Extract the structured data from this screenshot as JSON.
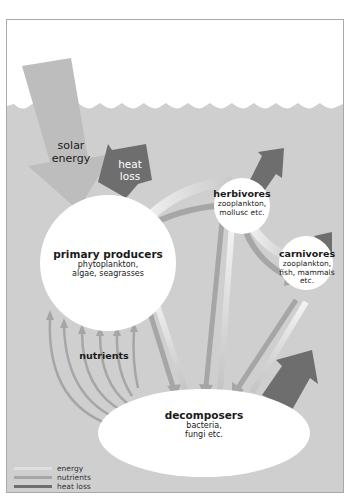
{
  "colors": {
    "background": "#ffffff",
    "water": "#cfcfcf",
    "frame": "#a9a9a9",
    "energy": "#dedede",
    "nutrients": "#a6a6a6",
    "heat_loss": "#6e6e6e",
    "node_fill": "#ffffff"
  },
  "labels": {
    "solar_energy": [
      "solar",
      "energy"
    ],
    "heat_loss": [
      "heat",
      "loss"
    ],
    "nutrients": "nutrients"
  },
  "nodes": {
    "primary_producers": {
      "title": "primary producers",
      "lines": [
        "phytoplankton,",
        "algae, seagrasses"
      ]
    },
    "herbivores": {
      "title": "herbivores",
      "lines": [
        "zooplankton,",
        "mollusc etc."
      ]
    },
    "carnivores": {
      "title": "carnivores",
      "lines": [
        "zooplankton,",
        "fish, mammals",
        "etc."
      ]
    },
    "decomposers": {
      "title": "decomposers",
      "lines": [
        "bacteria,",
        "fungi etc."
      ]
    }
  },
  "legend": [
    {
      "label": "energy",
      "color": "#dedede"
    },
    {
      "label": "nutrients",
      "color": "#a6a6a6"
    },
    {
      "label": "heat loss",
      "color": "#6e6e6e"
    }
  ]
}
